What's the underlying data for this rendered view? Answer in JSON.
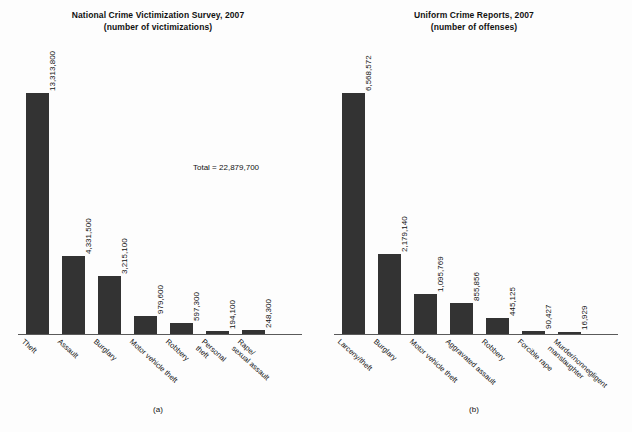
{
  "figure": {
    "background": "#fdfdfd",
    "bar_color": "#333333",
    "axis_color": "#5a5a5a"
  },
  "panels": [
    {
      "caption": "(a)",
      "title_line1": "National Crime Victimization Survey, 2007",
      "title_line2": "(number of victimizations)",
      "total_label": "Total = 22,879,700"
    },
    {
      "caption": "(b)",
      "title_line1": "Uniform Crime Reports, 2007",
      "title_line2": "(number of offenses)",
      "total_label": "Total = 11,251,818"
    }
  ],
  "chart_data": [
    {
      "type": "bar",
      "title": "National Crime Victimization Survey, 2007 (number of victimizations)",
      "subtitle": "(number of victimizations)",
      "xlabel": "",
      "ylabel": "",
      "ylim": [
        0,
        14000000
      ],
      "grid": false,
      "legend": false,
      "annotations": [
        "Total = 22,879,700",
        "(a)"
      ],
      "categories": [
        "Theft",
        "Assault",
        "Burglary",
        "Motor vehicle theft",
        "Robbery",
        "Personal theft",
        "Rape/ sexual assault"
      ],
      "category_lines": [
        [
          "Theft"
        ],
        [
          "Assault"
        ],
        [
          "Burglary"
        ],
        [
          "Motor vehicle theft"
        ],
        [
          "Robbery"
        ],
        [
          "Personal",
          "theft"
        ],
        [
          "Rape/",
          "sexual assault"
        ]
      ],
      "values": [
        13313800,
        4331500,
        3215100,
        979600,
        597300,
        194100,
        248300
      ],
      "value_labels": [
        "13,313,800",
        "4,331,500",
        "3,215,100",
        "979,600",
        "597,300",
        "194,100",
        "248,300"
      ],
      "total": 22879700
    },
    {
      "type": "bar",
      "title": "Uniform Crime Reports, 2007 (number of offenses)",
      "subtitle": "(number of offenses)",
      "xlabel": "",
      "ylabel": "",
      "ylim": [
        0,
        7000000
      ],
      "grid": false,
      "legend": false,
      "annotations": [
        "Total = 11,251,818",
        "(b)"
      ],
      "categories": [
        "Larceny/theft",
        "Burglary",
        "Motor vehicle theft",
        "Aggravated assault",
        "Robbery",
        "Forcible rape",
        "Murder/nonnegligent manslaughter"
      ],
      "category_lines": [
        [
          "Larceny/theft"
        ],
        [
          "Burglary"
        ],
        [
          "Motor vehicle theft"
        ],
        [
          "Aggravated assault"
        ],
        [
          "Robbery"
        ],
        [
          "Forcible rape"
        ],
        [
          "Murder/nonnegligent",
          "manslaughter"
        ]
      ],
      "values": [
        6568572,
        2179140,
        1095769,
        855856,
        445125,
        90427,
        16929
      ],
      "value_labels": [
        "6,568,572",
        "2,179,140",
        "1,095,769",
        "855,856",
        "445,125",
        "90,427",
        "16,929"
      ],
      "total": 11251818
    }
  ]
}
